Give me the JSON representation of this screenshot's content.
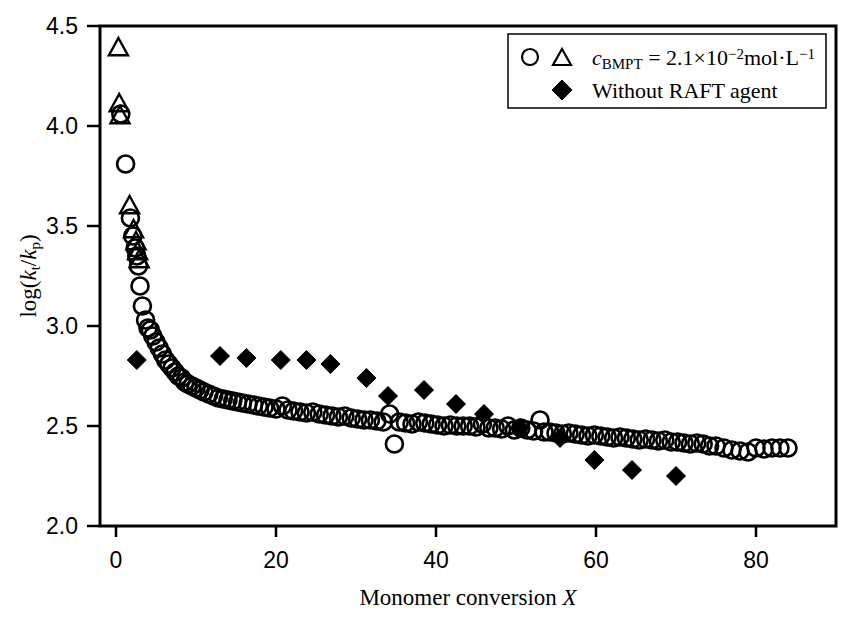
{
  "chart_data": {
    "type": "scatter",
    "title": "",
    "xlabel": "Monomer conversion X",
    "ylabel": "log(kt/kp)",
    "xlabel_parts": {
      "text": "Monomer conversion ",
      "italic_symbol": "X"
    },
    "ylabel_parts": {
      "prefix": "log(",
      "k1": "k",
      "sub1": "t",
      "slash": "/",
      "k2": "k",
      "sub2": "p",
      "suffix": ")"
    },
    "xlim": [
      -2,
      90
    ],
    "ylim": [
      2.0,
      4.5
    ],
    "xticks": [
      0,
      20,
      40,
      60,
      80
    ],
    "yticks": [
      2.0,
      2.5,
      3.0,
      3.5,
      4.0,
      4.5
    ],
    "xticklabels": [
      "0",
      "20",
      "40",
      "60",
      "80"
    ],
    "yticklabels": [
      "2.0",
      "2.5",
      "3.0",
      "3.5",
      "4.0",
      "4.5"
    ],
    "grid": false,
    "frame": true,
    "legend_position": "top-right",
    "marker_color": "#000000",
    "series": [
      {
        "name": "c_BMPT = 2.1x10-2 mol/L (circles)",
        "marker": "open-circle",
        "points": [
          [
            0.6,
            4.06
          ],
          [
            1.2,
            3.81
          ],
          [
            1.8,
            3.54
          ],
          [
            2.1,
            3.45
          ],
          [
            2.4,
            3.39
          ],
          [
            2.6,
            3.35
          ],
          [
            2.8,
            3.3
          ],
          [
            3.0,
            3.2
          ],
          [
            3.3,
            3.1
          ],
          [
            3.7,
            3.03
          ],
          [
            4.0,
            2.99
          ],
          [
            4.3,
            2.98
          ],
          [
            4.6,
            2.95
          ],
          [
            5.0,
            2.92
          ],
          [
            5.4,
            2.89
          ],
          [
            5.8,
            2.86
          ],
          [
            6.2,
            2.83
          ],
          [
            6.6,
            2.81
          ],
          [
            7.0,
            2.79
          ],
          [
            7.4,
            2.77
          ],
          [
            7.8,
            2.75
          ],
          [
            8.2,
            2.74
          ],
          [
            8.6,
            2.72
          ],
          [
            9.0,
            2.71
          ],
          [
            9.5,
            2.7
          ],
          [
            10.0,
            2.69
          ],
          [
            10.5,
            2.68
          ],
          [
            11.0,
            2.67
          ],
          [
            11.6,
            2.66
          ],
          [
            12.2,
            2.65
          ],
          [
            12.8,
            2.64
          ],
          [
            13.4,
            2.635
          ],
          [
            14.0,
            2.63
          ],
          [
            14.6,
            2.625
          ],
          [
            15.2,
            2.62
          ],
          [
            15.8,
            2.615
          ],
          [
            16.5,
            2.61
          ],
          [
            17.2,
            2.605
          ],
          [
            17.8,
            2.6
          ],
          [
            18.5,
            2.595
          ],
          [
            19.2,
            2.59
          ],
          [
            20.0,
            2.585
          ],
          [
            20.8,
            2.6
          ],
          [
            21.5,
            2.58
          ],
          [
            22.2,
            2.575
          ],
          [
            23.0,
            2.57
          ],
          [
            23.8,
            2.565
          ],
          [
            24.6,
            2.57
          ],
          [
            25.4,
            2.56
          ],
          [
            26.2,
            2.555
          ],
          [
            27.0,
            2.55
          ],
          [
            27.8,
            2.545
          ],
          [
            28.6,
            2.55
          ],
          [
            29.4,
            2.54
          ],
          [
            30.2,
            2.535
          ],
          [
            31.0,
            2.53
          ],
          [
            31.8,
            2.53
          ],
          [
            32.6,
            2.525
          ],
          [
            33.4,
            2.52
          ],
          [
            34.2,
            2.56
          ],
          [
            34.8,
            2.41
          ],
          [
            35.4,
            2.52
          ],
          [
            36.2,
            2.515
          ],
          [
            37.0,
            2.51
          ],
          [
            37.8,
            2.52
          ],
          [
            38.6,
            2.515
          ],
          [
            39.4,
            2.51
          ],
          [
            40.2,
            2.505
          ],
          [
            41.0,
            2.5
          ],
          [
            41.8,
            2.505
          ],
          [
            42.6,
            2.5
          ],
          [
            43.4,
            2.5
          ],
          [
            44.2,
            2.5
          ],
          [
            45.0,
            2.495
          ],
          [
            45.8,
            2.51
          ],
          [
            46.6,
            2.49
          ],
          [
            47.4,
            2.49
          ],
          [
            48.2,
            2.485
          ],
          [
            49.0,
            2.5
          ],
          [
            49.8,
            2.48
          ],
          [
            50.6,
            2.49
          ],
          [
            51.4,
            2.48
          ],
          [
            52.2,
            2.475
          ],
          [
            53.0,
            2.53
          ],
          [
            53.5,
            2.47
          ],
          [
            54.2,
            2.47
          ],
          [
            55.0,
            2.465
          ],
          [
            55.8,
            2.46
          ],
          [
            56.6,
            2.465
          ],
          [
            57.4,
            2.46
          ],
          [
            58.2,
            2.455
          ],
          [
            59.0,
            2.45
          ],
          [
            59.8,
            2.455
          ],
          [
            60.6,
            2.45
          ],
          [
            61.4,
            2.445
          ],
          [
            62.2,
            2.44
          ],
          [
            63.0,
            2.445
          ],
          [
            63.8,
            2.44
          ],
          [
            64.6,
            2.435
          ],
          [
            65.4,
            2.43
          ],
          [
            66.2,
            2.435
          ],
          [
            67.0,
            2.43
          ],
          [
            67.8,
            2.425
          ],
          [
            68.6,
            2.43
          ],
          [
            69.4,
            2.42
          ],
          [
            70.2,
            2.42
          ],
          [
            71.0,
            2.415
          ],
          [
            71.8,
            2.41
          ],
          [
            72.6,
            2.415
          ],
          [
            73.4,
            2.41
          ],
          [
            74.2,
            2.4
          ],
          [
            75.0,
            2.4
          ],
          [
            76.0,
            2.39
          ],
          [
            77.0,
            2.38
          ],
          [
            78.0,
            2.375
          ],
          [
            79.0,
            2.37
          ],
          [
            80.0,
            2.39
          ],
          [
            81.0,
            2.385
          ],
          [
            82.0,
            2.39
          ],
          [
            83.0,
            2.39
          ],
          [
            84.0,
            2.39
          ]
        ]
      },
      {
        "name": "c_BMPT = 2.1x10-2 mol/L (triangles)",
        "marker": "open-triangle",
        "points": [
          [
            0.3,
            4.39
          ],
          [
            0.4,
            4.11
          ],
          [
            0.5,
            4.05
          ],
          [
            1.7,
            3.6
          ],
          [
            2.2,
            3.48
          ],
          [
            2.5,
            3.42
          ],
          [
            2.7,
            3.37
          ],
          [
            2.9,
            3.33
          ]
        ]
      },
      {
        "name": "Without RAFT agent",
        "marker": "filled-diamond",
        "points": [
          [
            2.6,
            2.83
          ],
          [
            13.0,
            2.85
          ],
          [
            16.3,
            2.84
          ],
          [
            20.6,
            2.83
          ],
          [
            23.8,
            2.83
          ],
          [
            26.8,
            2.81
          ],
          [
            31.3,
            2.74
          ],
          [
            34.0,
            2.65
          ],
          [
            38.5,
            2.68
          ],
          [
            42.5,
            2.61
          ],
          [
            46.0,
            2.56
          ],
          [
            50.5,
            2.49
          ],
          [
            55.5,
            2.44
          ],
          [
            59.8,
            2.33
          ],
          [
            64.5,
            2.28
          ],
          [
            70.0,
            2.25
          ]
        ]
      }
    ]
  },
  "legend": {
    "entries": [
      {
        "markers": [
          "open-circle",
          "open-triangle"
        ],
        "label_prefix": "c",
        "label_sub": "BMPT",
        "label_eq": " = 2.1",
        "label_times": "×",
        "label_base": "10",
        "label_exp": "−2",
        "label_unit": "mol·L",
        "label_unit_exp": "−1"
      },
      {
        "markers": [
          "filled-diamond"
        ],
        "label": "Without RAFT agent"
      }
    ]
  },
  "axes": {
    "x_title_text": "Monomer conversion ",
    "x_title_symbol": "X",
    "y_title_prefix": "log(",
    "y_title_k1": "k",
    "y_title_sub1": "t",
    "y_title_slash": "/",
    "y_title_k2": "k",
    "y_title_sub2": "p",
    "y_title_suffix": ")"
  }
}
